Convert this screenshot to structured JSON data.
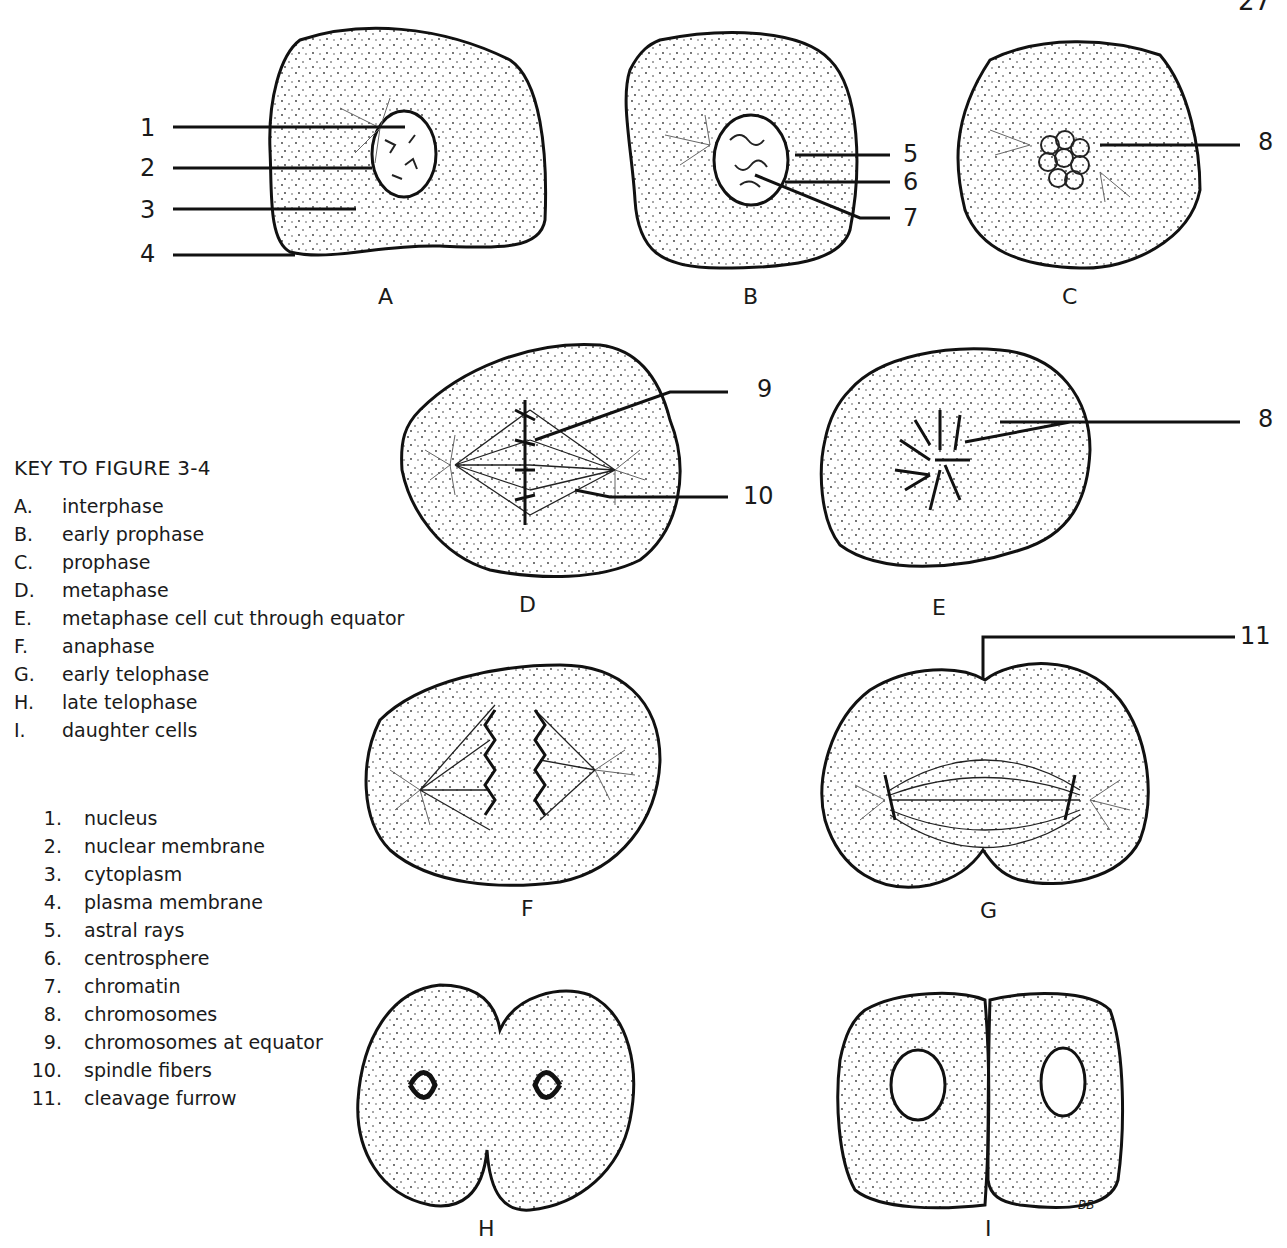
{
  "page_number": "27",
  "key": {
    "title": "KEY TO FIGURE 3-4",
    "stages": [
      {
        "key": "A.",
        "label": "interphase"
      },
      {
        "key": "B.",
        "label": "early prophase"
      },
      {
        "key": "C.",
        "label": "prophase"
      },
      {
        "key": "D.",
        "label": "metaphase"
      },
      {
        "key": "E.",
        "label": "metaphase cell cut  through equator"
      },
      {
        "key": "F.",
        "label": "anaphase"
      },
      {
        "key": "G.",
        "label": "early telophase"
      },
      {
        "key": "H.",
        "label": "late telophase"
      },
      {
        "key": "I.",
        "label": "daughter cells"
      }
    ],
    "parts": [
      {
        "key": "1.",
        "label": "nucleus"
      },
      {
        "key": "2.",
        "label": "nuclear membrane"
      },
      {
        "key": "3.",
        "label": "cytoplasm"
      },
      {
        "key": "4.",
        "label": "plasma membrane"
      },
      {
        "key": "5.",
        "label": "astral rays"
      },
      {
        "key": "6.",
        "label": "centrosphere"
      },
      {
        "key": "7.",
        "label": "chromatin"
      },
      {
        "key": "8.",
        "label": "chromosomes"
      },
      {
        "key": "9.",
        "label": "chromosomes at equator"
      },
      {
        "key": "10.",
        "label": "spindle fibers"
      },
      {
        "key": "11.",
        "label": "cleavage furrow"
      }
    ]
  },
  "cells": {
    "A": {
      "label": "A",
      "callouts": [
        "1",
        "2",
        "3",
        "4"
      ]
    },
    "B": {
      "label": "B",
      "callouts": [
        "5",
        "6",
        "7"
      ]
    },
    "C": {
      "label": "C",
      "callouts": [
        "8"
      ]
    },
    "D": {
      "label": "D",
      "callouts": [
        "9",
        "10"
      ]
    },
    "E": {
      "label": "E",
      "callouts": [
        "8"
      ]
    },
    "F": {
      "label": "F",
      "callouts": []
    },
    "G": {
      "label": "G",
      "callouts": [
        "11"
      ]
    },
    "H": {
      "label": "H",
      "callouts": []
    },
    "I": {
      "label": "I",
      "callouts": []
    }
  },
  "signature": "BB"
}
